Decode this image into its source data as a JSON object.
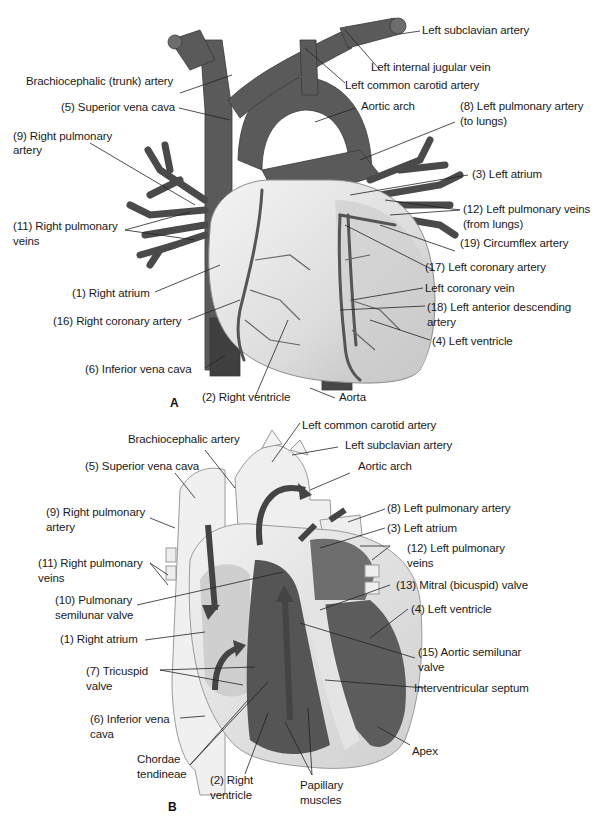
{
  "figure": {
    "panel_a": {
      "letter": "A",
      "labels": {
        "left_subclavian": "Left subclavian artery",
        "left_internal_jugular": "Left internal jugular vein",
        "brachiocephalic": "Brachiocephalic (trunk) artery",
        "left_common_carotid": "Left common carotid artery",
        "superior_vena_cava": "(5) Superior vena cava",
        "aortic_arch": "Aortic arch",
        "left_pulm_artery_1": "(8) Left pulmonary artery",
        "left_pulm_artery_2": "(to lungs)",
        "right_pulm_artery_1": "(9) Right pulmonary",
        "right_pulm_artery_2": "artery",
        "left_atrium": "(3) Left atrium",
        "left_pulm_veins_1": "(12) Left pulmonary veins",
        "left_pulm_veins_2": "(from lungs)",
        "right_pulm_veins_1": "(11) Right pulmonary",
        "right_pulm_veins_2": "veins",
        "circumflex": "(19) Circumflex artery",
        "left_coronary_artery": "(17) Left coronary artery",
        "right_atrium": "(1) Right atrium",
        "left_coronary_vein": "Left coronary vein",
        "lad_1": "(18) Left anterior descending",
        "lad_2": "artery",
        "right_coronary": "(16) Right coronary artery",
        "left_ventricle": "(4) Left ventricle",
        "inferior_vena_cava": "(6) Inferior vena cava",
        "right_ventricle": "(2) Right ventricle",
        "aorta": "Aorta"
      }
    },
    "panel_b": {
      "letter": "B",
      "labels": {
        "left_common_carotid": "Left common carotid artery",
        "brachiocephalic": "Brachiocephalic artery",
        "left_subclavian": "Left subclavian artery",
        "superior_vena_cava": "(5) Superior vena cava",
        "aortic_arch": "Aortic arch",
        "left_pulm_artery": "(8) Left pulmonary artery",
        "right_pulm_artery_1": "(9) Right pulmonary",
        "right_pulm_artery_2": "artery",
        "left_atrium": "(3) Left atrium",
        "left_pulm_veins_1": "(12) Left pulmonary",
        "left_pulm_veins_2": "veins",
        "right_pulm_veins_1": "(11) Right pulmonary",
        "right_pulm_veins_2": "veins",
        "mitral_valve": "(13) Mitral (bicuspid) valve",
        "pulm_semilunar_1": "(10) Pulmonary",
        "pulm_semilunar_2": "semilunar valve",
        "left_ventricle": "(4) Left ventricle",
        "right_atrium": "(1) Right atrium",
        "aortic_semilunar_1": "(15) Aortic semilunar",
        "aortic_semilunar_2": "valve",
        "tricuspid_1": "(7) Tricuspid",
        "tricuspid_2": "valve",
        "interventricular_septum": "Interventricular septum",
        "inferior_vena_cava_1": "(6) Inferior vena",
        "inferior_vena_cava_2": "cava",
        "chordae_1": "Chordae",
        "chordae_2": "tendineae",
        "apex": "Apex",
        "right_ventricle_1": "(2) Right",
        "right_ventricle_2": "ventricle",
        "papillary_1": "Papillary",
        "papillary_2": "muscles"
      }
    },
    "colors": {
      "vessel": "#5a5a5a",
      "vessel_dark": "#3f3f3f",
      "heart_light": "#e8e8e8",
      "heart_mid": "#c9c9c9",
      "chamber_dark": "#555555",
      "leader": "#222222"
    }
  }
}
